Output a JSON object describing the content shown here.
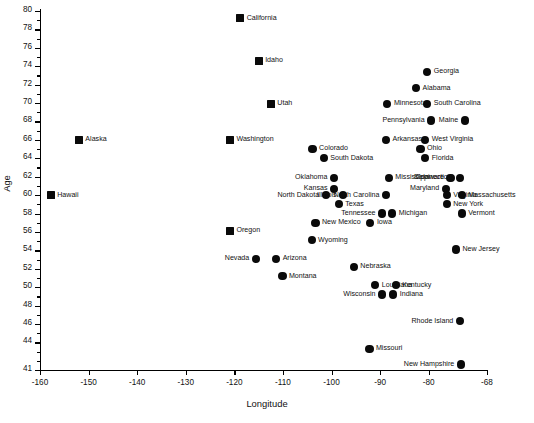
{
  "chart_data": {
    "type": "scatter",
    "title": "",
    "xlabel": "Longitude",
    "ylabel": "Age",
    "xlim": [
      -160,
      -68
    ],
    "ylim": [
      41,
      80
    ],
    "grid": false,
    "legend": null,
    "xticks": [
      -160,
      -150,
      -140,
      -130,
      -120,
      -110,
      -100,
      -90,
      -80,
      -68
    ],
    "xticklabels": [
      "-160",
      "-150",
      "-140",
      "-130",
      "-120",
      "-110",
      "-100",
      "-90",
      "-80",
      "-68"
    ],
    "yticks": [
      41,
      44,
      46,
      48,
      50,
      52,
      54,
      56,
      58,
      60,
      62,
      64,
      66,
      68,
      70,
      72,
      74,
      76,
      78,
      80
    ],
    "yticklabels": [
      "41",
      "44",
      "46",
      "48",
      "50",
      "52",
      "54",
      "56",
      "58",
      "60",
      "62",
      "64",
      "66",
      "68",
      "70",
      "72",
      "74",
      "76",
      "78",
      "80"
    ],
    "y_minor_ticks": true,
    "marker_color": "#0a0a0a",
    "points": [
      {
        "label": "California",
        "x": -118.8,
        "y": 79.2,
        "marker": "square",
        "side": "right"
      },
      {
        "label": "Idaho",
        "x": -115.0,
        "y": 74.6,
        "marker": "square",
        "side": "right"
      },
      {
        "label": "Georgia",
        "x": -80.3,
        "y": 73.4,
        "marker": "circle",
        "side": "right"
      },
      {
        "label": "Alabama",
        "x": -82.6,
        "y": 71.6,
        "marker": "circle",
        "side": "right"
      },
      {
        "label": "Utah",
        "x": -112.5,
        "y": 69.9,
        "marker": "square",
        "side": "right"
      },
      {
        "label": "Minnesota",
        "x": -88.5,
        "y": 69.9,
        "marker": "circle",
        "side": "right"
      },
      {
        "label": "South Carolina",
        "x": -80.3,
        "y": 69.9,
        "marker": "circle",
        "side": "right"
      },
      {
        "label": "Pennsylvania",
        "x": -79.5,
        "y": 68.1,
        "marker": "circle",
        "side": "left"
      },
      {
        "label": "Maine",
        "x": -72.6,
        "y": 68.1,
        "marker": "circle",
        "side": "left"
      },
      {
        "label": "Washington",
        "x": -120.9,
        "y": 66.0,
        "marker": "square",
        "side": "right"
      },
      {
        "label": "Alaska",
        "x": -152.0,
        "y": 66.0,
        "marker": "square",
        "side": "right"
      },
      {
        "label": "Arkansas",
        "x": -88.8,
        "y": 66.0,
        "marker": "circle",
        "side": "right"
      },
      {
        "label": "West Virginia",
        "x": -80.7,
        "y": 66.0,
        "marker": "circle",
        "side": "right"
      },
      {
        "label": "Colorado",
        "x": -103.9,
        "y": 65.0,
        "marker": "circle",
        "side": "right"
      },
      {
        "label": "Ohio",
        "x": -81.7,
        "y": 65.0,
        "marker": "circle",
        "side": "right"
      },
      {
        "label": "South Dakota",
        "x": -101.6,
        "y": 64.0,
        "marker": "circle",
        "side": "right"
      },
      {
        "label": "Florida",
        "x": -80.7,
        "y": 64.0,
        "marker": "circle",
        "side": "right"
      },
      {
        "label": "Oklahoma",
        "x": -99.5,
        "y": 61.9,
        "marker": "circle",
        "side": "left"
      },
      {
        "label": "Mississippi",
        "x": -88.2,
        "y": 61.9,
        "marker": "circle",
        "side": "right"
      },
      {
        "label": "Delaware",
        "x": -75.5,
        "y": 61.9,
        "marker": "circle",
        "side": "left"
      },
      {
        "label": "Connecticut",
        "x": -73.6,
        "y": 61.9,
        "marker": "circle",
        "side": "left"
      },
      {
        "label": "Hawaii",
        "x": -157.8,
        "y": 60.0,
        "marker": "square",
        "side": "right"
      },
      {
        "label": "Kansas",
        "x": -99.5,
        "y": 60.7,
        "marker": "circle",
        "side": "left"
      },
      {
        "label": "Maryland",
        "x": -76.5,
        "y": 60.7,
        "marker": "circle",
        "side": "left"
      },
      {
        "label": "North Dakota",
        "x": -101.2,
        "y": 60.0,
        "marker": "circle",
        "side": "left"
      },
      {
        "label": "Illinois",
        "x": -97.6,
        "y": 60.0,
        "marker": "circle",
        "side": "left"
      },
      {
        "label": "North Carolina",
        "x": -88.8,
        "y": 60.0,
        "marker": "circle",
        "side": "left"
      },
      {
        "label": "Virginia",
        "x": -76.3,
        "y": 60.0,
        "marker": "circle",
        "side": "right"
      },
      {
        "label": "Massachusetts",
        "x": -73.2,
        "y": 60.0,
        "marker": "circle",
        "side": "right"
      },
      {
        "label": "Texas",
        "x": -98.5,
        "y": 59.0,
        "marker": "circle",
        "side": "right"
      },
      {
        "label": "New York",
        "x": -76.3,
        "y": 59.0,
        "marker": "circle",
        "side": "right"
      },
      {
        "label": "Tennessee",
        "x": -89.6,
        "y": 58.0,
        "marker": "circle",
        "side": "left"
      },
      {
        "label": "Michigan",
        "x": -87.5,
        "y": 58.0,
        "marker": "circle",
        "side": "right"
      },
      {
        "label": "Vermont",
        "x": -73.2,
        "y": 58.0,
        "marker": "circle",
        "side": "right"
      },
      {
        "label": "New Mexico",
        "x": -103.3,
        "y": 57.0,
        "marker": "circle",
        "side": "right"
      },
      {
        "label": "Iowa",
        "x": -92.0,
        "y": 57.0,
        "marker": "circle",
        "side": "right"
      },
      {
        "label": "Oregon",
        "x": -120.9,
        "y": 56.1,
        "marker": "square",
        "side": "right"
      },
      {
        "label": "Wyoming",
        "x": -104.1,
        "y": 55.1,
        "marker": "circle",
        "side": "right"
      },
      {
        "label": "New Jersey",
        "x": -74.4,
        "y": 54.1,
        "marker": "circle",
        "side": "right"
      },
      {
        "label": "Nevada",
        "x": -115.6,
        "y": 53.1,
        "marker": "circle",
        "side": "left"
      },
      {
        "label": "Arizona",
        "x": -111.4,
        "y": 53.1,
        "marker": "circle",
        "side": "right"
      },
      {
        "label": "Nebraska",
        "x": -95.4,
        "y": 52.2,
        "marker": "circle",
        "side": "right"
      },
      {
        "label": "Montana",
        "x": -110.1,
        "y": 51.2,
        "marker": "circle",
        "side": "right"
      },
      {
        "label": "Louisiana",
        "x": -91.0,
        "y": 50.2,
        "marker": "circle",
        "side": "right"
      },
      {
        "label": "Kentucky",
        "x": -86.8,
        "y": 50.2,
        "marker": "circle",
        "side": "right"
      },
      {
        "label": "Wisconsin",
        "x": -89.6,
        "y": 49.2,
        "marker": "circle",
        "side": "left"
      },
      {
        "label": "Indiana",
        "x": -87.3,
        "y": 49.2,
        "marker": "circle",
        "side": "right"
      },
      {
        "label": "Rhode Island",
        "x": -73.6,
        "y": 46.3,
        "marker": "circle",
        "side": "left"
      },
      {
        "label": "Missouri",
        "x": -92.2,
        "y": 43.3,
        "marker": "circle",
        "side": "right"
      },
      {
        "label": "New Hampshire",
        "x": -73.4,
        "y": 41.6,
        "marker": "circle",
        "side": "left"
      }
    ]
  }
}
